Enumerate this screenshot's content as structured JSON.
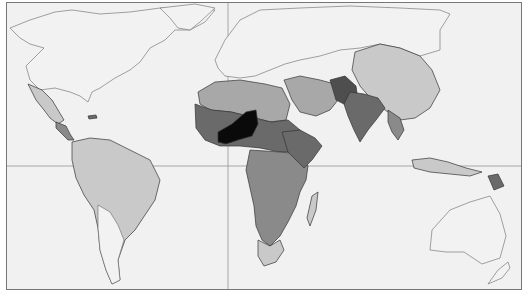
{
  "map": {
    "type": "choropleth",
    "projection": "world",
    "grid_lines": {
      "equator_y": 166,
      "meridian_x": 228
    },
    "colors": {
      "background": "#f1f1f1",
      "frame": "#777777",
      "no_data": "#f2f2f2",
      "level_1": "#c9c9c9",
      "level_2": "#a8a8a8",
      "level_3": "#8a8a8a",
      "level_4": "#6a6a6a",
      "level_5": "#4e4e4e",
      "highest": "#0a0a0a"
    },
    "legend": []
  }
}
